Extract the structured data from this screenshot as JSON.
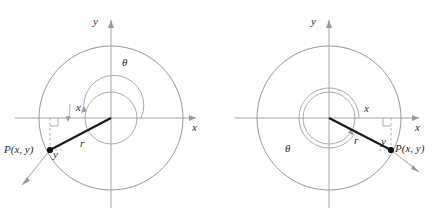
{
  "figure": {
    "type": "math-diagram",
    "background_color": "#ffffff",
    "axis_color": "#9a9a9a",
    "circle_color": "#8d8d8d",
    "ray_color": "#1a1a1a",
    "dash_color": "#8d8d8d",
    "label_color": "#2b2b2b"
  },
  "panels": [
    {
      "id": "left",
      "name": "quadrant-three-diagram",
      "axes": {
        "x_label": "x",
        "y_label": "y"
      },
      "angle": {
        "label": "θ",
        "position": "upper-right",
        "sweep_degrees": 205,
        "direction": "counterclockwise"
      },
      "radius": {
        "label": "r"
      },
      "point": {
        "label": "P(x, y)",
        "quadrant": 3
      },
      "legs": {
        "x_label": "x",
        "y_label": "y"
      }
    },
    {
      "id": "right",
      "name": "quadrant-four-diagram",
      "axes": {
        "x_label": "x",
        "y_label": "y"
      },
      "angle": {
        "label": "θ",
        "position": "lower-left",
        "sweep_degrees": 325,
        "direction": "counterclockwise"
      },
      "radius": {
        "label": "r"
      },
      "point": {
        "label": "P(x, y)",
        "quadrant": 4
      },
      "legs": {
        "x_label": "x",
        "y_label": "y"
      }
    }
  ]
}
